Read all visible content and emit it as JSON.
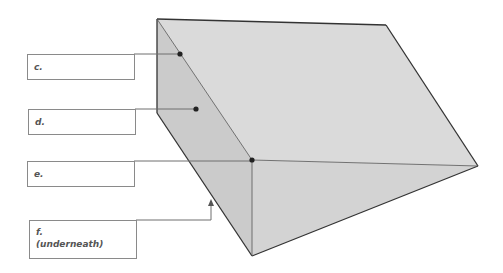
{
  "diagram": {
    "type": "triangular-prism-labeling",
    "colors": {
      "top_face": "#dadada",
      "left_face": "#cbcbcb",
      "front_face": "#d3d3d3",
      "edge": "#333333",
      "leader": "#777777",
      "dot": "#222222"
    },
    "labels": [
      {
        "id": "c",
        "text": "c.",
        "sub": ""
      },
      {
        "id": "d",
        "text": "d.",
        "sub": ""
      },
      {
        "id": "e",
        "text": "e.",
        "sub": ""
      },
      {
        "id": "f",
        "text": "f.",
        "sub": "(underneath)"
      }
    ]
  }
}
